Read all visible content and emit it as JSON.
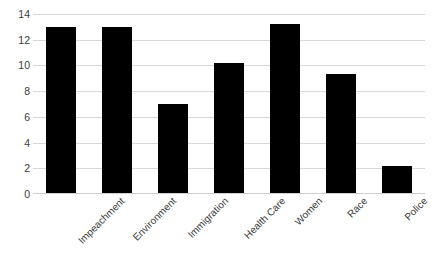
{
  "chart_data": {
    "type": "bar",
    "title": "",
    "xlabel": "",
    "ylabel": "",
    "categories": [
      "Impeachment",
      "Environment",
      "Immigration",
      "Health Care",
      "Women",
      "Race",
      "Police"
    ],
    "values": [
      13.0,
      13.0,
      7.0,
      10.2,
      13.2,
      9.3,
      2.2
    ],
    "ylim": [
      0,
      14
    ],
    "yticks": [
      0,
      2,
      4,
      6,
      8,
      10,
      12,
      14
    ],
    "ytick_labels": [
      "0",
      "2",
      "4",
      "6",
      "8",
      "10",
      "12",
      "14"
    ],
    "grid": true,
    "legend": false,
    "bar_color": "#000000",
    "grid_color": "#d9d9d9",
    "background_color": "#ffffff",
    "tick_label_color": "#3b3b3b"
  }
}
